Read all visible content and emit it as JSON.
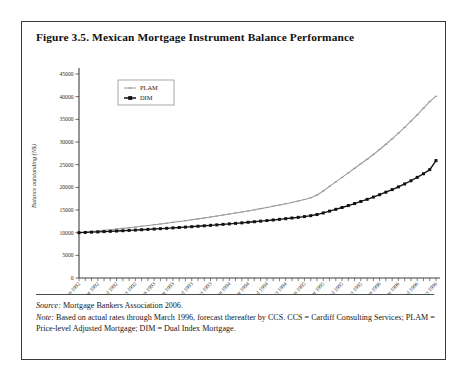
{
  "figure": {
    "title": "Figure 3.5. Mexican Mortgage Instrument Balance Performance",
    "source_lead": "Source:",
    "source_text": " Mortgage Bankers Association 2006.",
    "note_lead": "Note:",
    "note_text": " Based on actual rates through March 1996, forecast thereafter by CCS. CCS = Cardiff Consulting Services; PLAM = Price-level Adjusted Mortgage; DIM = Dual Index Mortgage."
  },
  "colors": {
    "plam": "#9a9a9a",
    "dim": "#121212",
    "frame": "#3a3a3a",
    "axis": "#3f3f3f",
    "background": "#ffffff"
  },
  "chart_data": {
    "type": "line",
    "title": "Mexican Mortgage Instrument Balance Performance",
    "xlabel": "",
    "ylabel": "Balance outstanding (N$)",
    "ylim": [
      0,
      45000
    ],
    "ytick_labels": [
      "0",
      "5000",
      "10000",
      "15000",
      "20000",
      "25000",
      "30000",
      "35000",
      "40000",
      "45000"
    ],
    "ytick_values": [
      0,
      5000,
      10000,
      15000,
      20000,
      25000,
      30000,
      35000,
      40000,
      45000
    ],
    "grid": false,
    "legend_position": "top-left",
    "x": [
      "Jan 1992",
      "Feb 1992",
      "Mar 1992",
      "Apr 1992",
      "May 1992",
      "Jun 1992",
      "Jul 1992",
      "Aug 1992",
      "Sep 1992",
      "Oct 1992",
      "Nov 1992",
      "Dec 1992",
      "Jan 1993",
      "Feb 1993",
      "Mar 1993",
      "Apr 1993",
      "May 1993",
      "Jun 1993",
      "Jul 1993",
      "Aug 1993",
      "Sep 1993",
      "Oct 1993",
      "Nov 1993",
      "Dec 1993",
      "Jan 1994",
      "Feb 1994",
      "Mar 1994",
      "Apr 1994",
      "May 1994",
      "Jun 1994",
      "Jul 1994",
      "Aug 1994",
      "Sep 1994",
      "Oct 1994",
      "Nov 1994",
      "Dec 1994",
      "Jan 1995",
      "Feb 1995",
      "Mar 1995",
      "Apr 1995",
      "May 1995",
      "Jun 1995",
      "Jul 1995",
      "Aug 1995",
      "Sep 1995",
      "Oct 1995",
      "Nov 1995",
      "Dec 1995",
      "Jan 1996",
      "Feb 1996",
      "Mar 1996",
      "Apr 1996",
      "May 1996",
      "Jun 1996",
      "Jul 1996",
      "Aug 1996",
      "Sep 1996",
      "Oct 1996"
    ],
    "xtick_labels": [
      "Jan 1992",
      "Apr 1992",
      "Jul 1992",
      "Oct 1992",
      "Jan 1993",
      "Apr 1993",
      "Jul 1993",
      "Oct 1993",
      "Jan 1994",
      "Apr 1994",
      "Jul 1994",
      "Oct 1994",
      "Jan 1995",
      "Apr 1995",
      "Jul 1995",
      "Oct 1995",
      "Jan 1996",
      "Apr 1996",
      "Jul 1996",
      "Oct 1996"
    ],
    "xtick_indices": [
      0,
      3,
      6,
      9,
      12,
      15,
      18,
      21,
      24,
      27,
      30,
      33,
      36,
      39,
      42,
      45,
      48,
      51,
      54,
      57
    ],
    "series": [
      {
        "name": "PLAM",
        "color": "#9a9a9a",
        "marker": "dash",
        "values": [
          10000,
          10120,
          10250,
          10380,
          10520,
          10660,
          10800,
          10950,
          11100,
          11260,
          11420,
          11580,
          11750,
          11920,
          12100,
          12280,
          12460,
          12650,
          12840,
          13040,
          13240,
          13450,
          13660,
          13880,
          14100,
          14330,
          14560,
          14800,
          15050,
          15300,
          15560,
          15830,
          16100,
          16380,
          16670,
          16970,
          17300,
          17700,
          18300,
          19200,
          20200,
          21200,
          22200,
          23200,
          24200,
          25200,
          26200,
          27250,
          28350,
          29500,
          30700,
          31950,
          33250,
          34600,
          36000,
          37450,
          38900,
          40100
        ]
      },
      {
        "name": "DIM",
        "color": "#121212",
        "marker": "square",
        "values": [
          10000,
          10050,
          10110,
          10170,
          10230,
          10290,
          10360,
          10430,
          10500,
          10570,
          10650,
          10720,
          10800,
          10880,
          10960,
          11050,
          11140,
          11230,
          11320,
          11420,
          11520,
          11620,
          11720,
          11830,
          11940,
          12050,
          12170,
          12290,
          12410,
          12540,
          12670,
          12800,
          12940,
          13080,
          13230,
          13380,
          13550,
          13750,
          14000,
          14350,
          14750,
          15150,
          15550,
          15980,
          16420,
          16880,
          17350,
          17850,
          18380,
          18930,
          19500,
          20100,
          20750,
          21450,
          22200,
          23000,
          23900,
          25900
        ]
      }
    ]
  }
}
